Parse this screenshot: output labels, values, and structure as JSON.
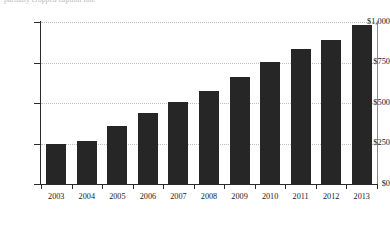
{
  "caption": {
    "text": "partially cropped caption line"
  },
  "chart_data": {
    "type": "bar",
    "title": "",
    "xlabel": "",
    "ylabel": "",
    "categories": [
      "2003",
      "2004",
      "2005",
      "2006",
      "2007",
      "2008",
      "2009",
      "2010",
      "2011",
      "2012",
      "2013"
    ],
    "values": [
      245,
      265,
      360,
      440,
      505,
      575,
      660,
      755,
      835,
      890,
      980
    ],
    "ylim": [
      0,
      1000
    ],
    "ytick_values": [
      0,
      250,
      500,
      750,
      1000
    ],
    "ytick_labels": [
      "$0",
      "$250",
      "$500",
      "$750",
      "$1,000"
    ],
    "grid": true,
    "legend": false,
    "bar_color": "#262626",
    "grid_color": "#bfbfbf",
    "axis_color": "#2b2b2b",
    "currency": "$"
  }
}
